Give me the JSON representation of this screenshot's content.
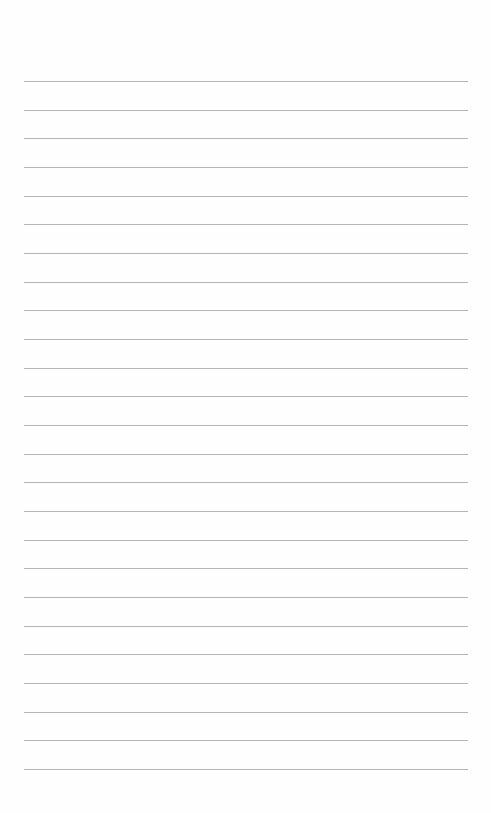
{
  "page": {
    "type": "lined-paper",
    "background_color": "#fefefe",
    "rule_color": "#b4b4b4",
    "rule_left": 24,
    "rule_width": 444,
    "first_rule_y": 81,
    "rule_spacing": 28.67,
    "rule_count": 25
  }
}
